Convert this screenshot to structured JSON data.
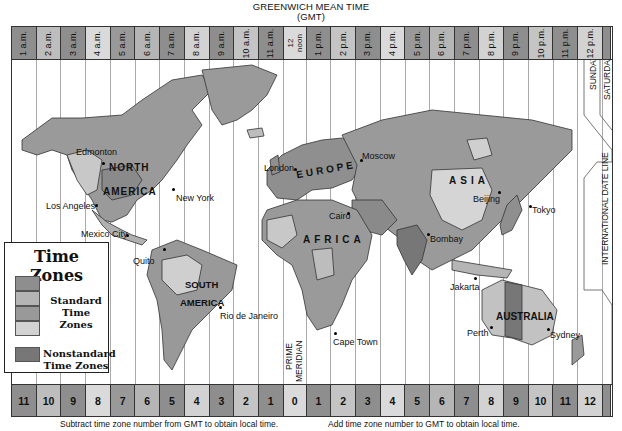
{
  "title": {
    "line1": "GREENWICH MEAN TIME",
    "line2": "(GMT)"
  },
  "top_band": [
    {
      "label": "1 a.m.",
      "color": "#8e8e8e"
    },
    {
      "label": "2 a.m.",
      "color": "#bdbdbd"
    },
    {
      "label": "3 a.m.",
      "color": "#8e8e8e"
    },
    {
      "label": "4 a.m.",
      "color": "#dadada"
    },
    {
      "label": "5 a.m.",
      "color": "#999999"
    },
    {
      "label": "6 a.m.",
      "color": "#b5b5b5"
    },
    {
      "label": "7 a.m.",
      "color": "#8e8e8e"
    },
    {
      "label": "8 a.m.",
      "color": "#d2d2d2"
    },
    {
      "label": "9 a.m.",
      "color": "#8e8e8e"
    },
    {
      "label": "10 a.m.",
      "color": "#c4c4c4"
    },
    {
      "label": "11 a.m.",
      "color": "#8e8e8e"
    },
    {
      "label": "12 noon",
      "color": "#dadada"
    },
    {
      "label": "1 p.m.",
      "color": "#8e8e8e"
    },
    {
      "label": "2 p.m.",
      "color": "#c4c4c4"
    },
    {
      "label": "3 p.m.",
      "color": "#8e8e8e"
    },
    {
      "label": "4 p.m.",
      "color": "#dadada"
    },
    {
      "label": "5 p.m.",
      "color": "#999999"
    },
    {
      "label": "6 p.m.",
      "color": "#b5b5b5"
    },
    {
      "label": "7 p.m.",
      "color": "#8e8e8e"
    },
    {
      "label": "8 p.m.",
      "color": "#d2d2d2"
    },
    {
      "label": "9 p.m.",
      "color": "#8e8e8e"
    },
    {
      "label": "10 p.m.",
      "color": "#c4c4c4"
    },
    {
      "label": "11 p.m.",
      "color": "#8e8e8e"
    },
    {
      "label": "12 p.m.",
      "color": "#d2d2d2"
    },
    {
      "label": "",
      "color": "#8e8e8e"
    }
  ],
  "bottom_band": [
    {
      "label": "11",
      "color": "#8e8e8e"
    },
    {
      "label": "10",
      "color": "#bdbdbd"
    },
    {
      "label": "9",
      "color": "#8e8e8e"
    },
    {
      "label": "8",
      "color": "#dadada"
    },
    {
      "label": "7",
      "color": "#999999"
    },
    {
      "label": "6",
      "color": "#b5b5b5"
    },
    {
      "label": "5",
      "color": "#8e8e8e"
    },
    {
      "label": "4",
      "color": "#d2d2d2"
    },
    {
      "label": "3",
      "color": "#8e8e8e"
    },
    {
      "label": "2",
      "color": "#c4c4c4"
    },
    {
      "label": "1",
      "color": "#8e8e8e"
    },
    {
      "label": "0",
      "color": "#dadada"
    },
    {
      "label": "1",
      "color": "#8e8e8e"
    },
    {
      "label": "2",
      "color": "#c4c4c4"
    },
    {
      "label": "3",
      "color": "#8e8e8e"
    },
    {
      "label": "4",
      "color": "#dadada"
    },
    {
      "label": "5",
      "color": "#999999"
    },
    {
      "label": "6",
      "color": "#b5b5b5"
    },
    {
      "label": "7",
      "color": "#8e8e8e"
    },
    {
      "label": "8",
      "color": "#d2d2d2"
    },
    {
      "label": "9",
      "color": "#8e8e8e"
    },
    {
      "label": "10",
      "color": "#c4c4c4"
    },
    {
      "label": "11",
      "color": "#8e8e8e"
    },
    {
      "label": "12",
      "color": "#d2d2d2"
    },
    {
      "label": "",
      "color": "#8e8e8e"
    }
  ],
  "captions": {
    "west": "Subtract time zone number from GMT to obtain local time.",
    "east": "Add time zone number to GMT to obtain local time."
  },
  "continents": {
    "north_america_1": "NORTH",
    "north_america_2": "AMERICA",
    "south_america_1": "SOUTH",
    "south_america_2": "AMERICA",
    "europe": "EUROPE",
    "africa": "AFRICA",
    "asia": "ASIA",
    "australia": "AUSTRALIA"
  },
  "cities": {
    "edmonton": "Edmonton",
    "los_angeles": "Los Angeles",
    "new_york": "New York",
    "mexico_city": "Mexico City",
    "quito": "Quito",
    "rio": "Rio de Janeiro",
    "london": "London",
    "moscow": "Moscow",
    "cairo": "Cairo",
    "cape_town": "Cape Town",
    "bombay": "Bombay",
    "beijing": "Beijing",
    "tokyo": "Tokyo",
    "jakarta": "Jakarta",
    "perth": "Perth",
    "sydney": "Sydney"
  },
  "annotations": {
    "prime_meridian_1": "PRIME",
    "prime_meridian_2": "MERIDIAN",
    "date_line": "INTERNATIONAL DATE LINE",
    "sunday": "SUNDAY",
    "saturday": "SATURDAY"
  },
  "legend": {
    "title": "Time Zones",
    "standard_label_1": "Standard",
    "standard_label_2": "Time Zones",
    "nonstandard_label_1": "Nonstandard",
    "nonstandard_label_2": "Time Zones",
    "standard_colors": [
      "#8e8e8e",
      "#b5b5b5",
      "#999999",
      "#d2d2d2"
    ],
    "nonstandard_color": "#777777"
  }
}
